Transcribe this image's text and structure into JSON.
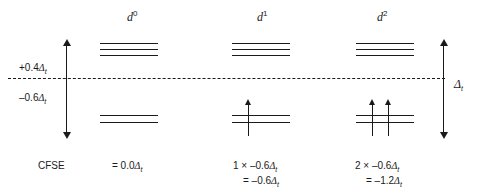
{
  "figure": {
    "type": "energy-level-diagram",
    "baseline_label": "barycentre"
  },
  "axis": {
    "upper_label": "+0.4",
    "upper_symbol": "Δ",
    "upper_subscript": "t",
    "lower_label": "–0.6",
    "lower_symbol": "Δ",
    "lower_subscript": "t",
    "split_symbol": "Δ",
    "split_subscript": "t",
    "upper_value": 0.4,
    "lower_value": -0.6
  },
  "columns": [
    {
      "id": "d0",
      "header_base": "d",
      "header_sup": "0",
      "upper_levels": 3,
      "lower_levels": 2,
      "electrons_upper": 0,
      "electrons_lower": 0,
      "cfse_lines": [
        "= 0.0Δt"
      ],
      "cfse_line1_pre": "= 0.0",
      "cfse_line1_sym": "Δ",
      "cfse_line1_sub": "t",
      "cfse_line2_pre": "",
      "cfse_line2_sym": "",
      "cfse_line2_sub": "",
      "cfse_value": 0.0
    },
    {
      "id": "d1",
      "header_base": "d",
      "header_sup": "1",
      "upper_levels": 3,
      "lower_levels": 2,
      "electrons_upper": 0,
      "electrons_lower": 1,
      "cfse_lines": [
        "1 × –0.6Δt",
        "= –0.6Δt"
      ],
      "cfse_line1_pre": "1 × –0.6",
      "cfse_line1_sym": "Δ",
      "cfse_line1_sub": "t",
      "cfse_line2_pre": "= –0.6",
      "cfse_line2_sym": "Δ",
      "cfse_line2_sub": "t",
      "cfse_value": -0.6
    },
    {
      "id": "d2",
      "header_base": "d",
      "header_sup": "2",
      "upper_levels": 3,
      "lower_levels": 2,
      "electrons_upper": 0,
      "electrons_lower": 2,
      "cfse_lines": [
        "2 × –0.6Δt",
        "= –1.2Δt"
      ],
      "cfse_line1_pre": "2 × –0.6",
      "cfse_line1_sym": "Δ",
      "cfse_line1_sub": "t",
      "cfse_line2_pre": "= –1.2",
      "cfse_line2_sym": "Δ",
      "cfse_line2_sub": "t",
      "cfse_value": -1.2
    }
  ],
  "row_labels": {
    "cfse": "CFSE"
  },
  "colors": {
    "ink": "#1a1a1a",
    "background": "#ffffff"
  }
}
